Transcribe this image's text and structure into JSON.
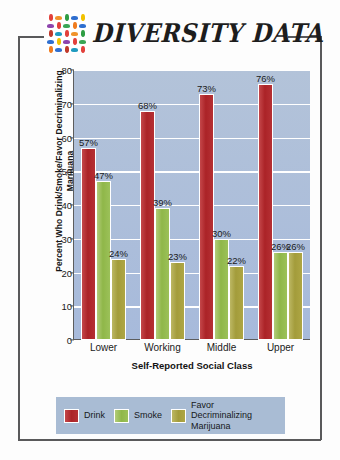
{
  "header": {
    "brand_title": "DIVERSITY DATA",
    "logo_name": "diversity-mosaic-logo"
  },
  "chart_data": {
    "type": "bar",
    "title": "",
    "xlabel": "Self-Reported Social Class",
    "ylabel": "Percent Who Drink/Smoke/Favor Decriminalizing Marijuana",
    "categories": [
      "Lower",
      "Working",
      "Middle",
      "Upper"
    ],
    "ylim": [
      0,
      80
    ],
    "yticks": [
      0,
      10,
      20,
      30,
      40,
      50,
      60,
      70,
      80
    ],
    "grid": true,
    "legend_position": "bottom",
    "series": [
      {
        "name": "Drink",
        "color": "#ab2327",
        "values": [
          57,
          68,
          73,
          76
        ],
        "labels": [
          "57%",
          "68%",
          "73%",
          "76%"
        ]
      },
      {
        "name": "Smoke",
        "color": "#8fb749",
        "values": [
          47,
          39,
          30,
          26
        ],
        "labels": [
          "47%",
          "39%",
          "30%",
          "26%"
        ]
      },
      {
        "name": "Favor Decriminalizing Marijuana",
        "color": "#a39c3b",
        "values": [
          24,
          23,
          22,
          26
        ],
        "labels": [
          "24%",
          "23%",
          "22%",
          "26%"
        ]
      }
    ],
    "plot_background": "#aebfd6",
    "gridline_color": "#ffffff"
  },
  "legend": [
    {
      "label": "Drink",
      "color": "#ab2327"
    },
    {
      "label": "Smoke",
      "color": "#8fb749"
    },
    {
      "label": "Favor\nDecriminalizing\nMarijuana",
      "color": "#a39c3b"
    }
  ]
}
